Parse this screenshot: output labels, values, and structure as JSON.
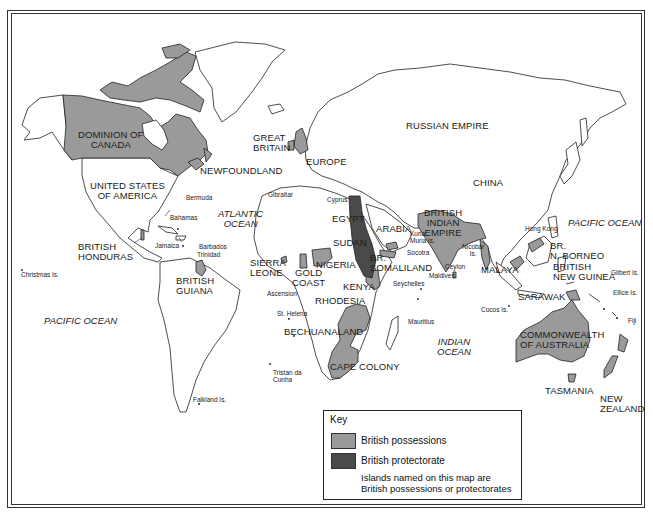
{
  "colors": {
    "possession": "#9a9a9a",
    "protectorate": "#4a4a4a",
    "land_outline": "#222222",
    "sea": "#ffffff"
  },
  "map": {
    "countries": {
      "canada": [
        "DOMINION OF",
        "CANADA"
      ],
      "newfoundland": "NEWFOUNDLAND",
      "usa": [
        "UNITED STATES",
        "OF AMERICA"
      ],
      "british_honduras": [
        "BRITISH",
        "HONDURAS"
      ],
      "british_guiana": [
        "BRITISH",
        "GUIANA"
      ],
      "great_britain": [
        "GREAT",
        "BRITAIN"
      ],
      "europe": "EUROPE",
      "russian_empire": "RUSSIAN EMPIRE",
      "china": "CHINA",
      "egypt": "EGYPT",
      "sudan": "SUDAN",
      "arabia": "ARABIA",
      "british_indian_empire": [
        "BRITISH",
        "INDIAN",
        "EMPIRE"
      ],
      "sierra_leone": [
        "SIERRA",
        "LEONE"
      ],
      "gold_coast": [
        "GOLD",
        "COAST"
      ],
      "nigeria": "NIGERIA",
      "br_somaliland": [
        "BR.",
        "SOMALILAND"
      ],
      "kenya": "KENYA",
      "rhodesia": "RHODESIA",
      "bechuanaland": "BECHUANALAND",
      "cape_colony": "CAPE COLONY",
      "malaya": "MALAYA",
      "br_n_borneo": [
        "BR.",
        "N. BORNEO"
      ],
      "sarawak": "SARAWAK",
      "british_new_guinea": [
        "BRITISH",
        "NEW GUINEA"
      ],
      "australia": [
        "COMMONWEALTH",
        "OF AUSTRALIA"
      ],
      "tasmania": "TASMANIA",
      "new_zealand": [
        "NEW",
        "ZEALAND"
      ]
    },
    "oceans": {
      "atlantic": [
        "ATLANTIC",
        "OCEAN"
      ],
      "pacific_east": "PACIFIC OCEAN",
      "pacific_west": "PACIFIC OCEAN",
      "indian": [
        "INDIAN",
        "OCEAN"
      ]
    },
    "islands": {
      "bermuda": "Bermuda",
      "bahamas": "Bahamas",
      "jamaica": "Jamaica",
      "barbados": "Barbados",
      "trinidad": "Trinidad",
      "gibraltar": "Gibraltar",
      "cyprus": "Cyprus",
      "christmas": "Christmas Is.",
      "ascension": "Ascension",
      "st_helena": "St. Helena",
      "tristan": [
        "Tristan da",
        "Cunha"
      ],
      "falkland": "Falkland Is.",
      "kuria_muria": [
        "Kuria",
        "Muria Is."
      ],
      "socotra": "Socotra",
      "seychelles": "Seychelles",
      "maldives": "Maldives",
      "ceylon": "Ceylon",
      "nicobar": [
        "Nicobar",
        "Is."
      ],
      "mauritius": "Mauritius",
      "cocos": "Cocos Is.",
      "hong_kong": "Hong Kong",
      "gilbert": "Gilbert Is.",
      "ellice": "Ellice Is.",
      "fiji": "Fiji"
    }
  },
  "legend": {
    "title": "Key",
    "items": [
      {
        "label": "British possessions",
        "color": "#9a9a9a"
      },
      {
        "label": "British protectorate",
        "color": "#4a4a4a"
      }
    ],
    "note": [
      "Islands named on this map are",
      "British possessions or protectorates"
    ]
  }
}
